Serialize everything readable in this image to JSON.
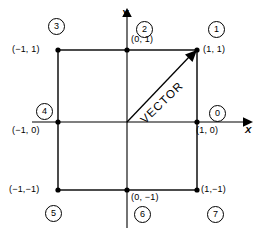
{
  "figure": {
    "axes": {
      "x_label": "X",
      "y_label": "Y"
    },
    "vector_label": "VECTOR",
    "origin": {
      "x": 127,
      "y": 122
    },
    "unit_px": 69,
    "points": [
      {
        "id": 0,
        "code": "0",
        "coord": "(1, 0)",
        "px": 197,
        "py": 122
      },
      {
        "id": 1,
        "code": "1",
        "coord": "(1, 1)",
        "px": 197,
        "py": 50
      },
      {
        "id": 2,
        "code": "2",
        "coord": "(0, 1)",
        "px": 127,
        "py": 50
      },
      {
        "id": 3,
        "code": "3",
        "coord": "(-1, 1)",
        "px": 58,
        "py": 50
      },
      {
        "id": 4,
        "code": "4",
        "coord": "(-1, 0)",
        "px": 58,
        "py": 122
      },
      {
        "id": 5,
        "code": "5",
        "coord": "(-1,-1)",
        "px": 58,
        "py": 190
      },
      {
        "id": 6,
        "code": "6",
        "coord": "(0, -1)",
        "px": 127,
        "py": 190
      },
      {
        "id": 7,
        "code": "7",
        "coord": "(1,-1)",
        "px": 197,
        "py": 190
      }
    ],
    "coord_labels": [
      {
        "name": "coord-label-top-left",
        "text": "(−1, 1)"
      },
      {
        "name": "coord-label-top-mid",
        "text": "(0, 1)"
      },
      {
        "name": "coord-label-top-right",
        "text": "(1, 1)"
      },
      {
        "name": "coord-label-mid-left",
        "text": "(−1, 0)"
      },
      {
        "name": "coord-label-mid-right",
        "text": "(1, 0)"
      },
      {
        "name": "coord-label-bottom-left",
        "text": "(−1,−1)"
      },
      {
        "name": "coord-label-bottom-mid",
        "text": "(0, −1)"
      },
      {
        "name": "coord-label-bottom-right",
        "text": "(1,−1)"
      }
    ],
    "direction_codes": [
      {
        "name": "direction-code-0",
        "text": "0"
      },
      {
        "name": "direction-code-1",
        "text": "1"
      },
      {
        "name": "direction-code-2",
        "text": "2"
      },
      {
        "name": "direction-code-3",
        "text": "3"
      },
      {
        "name": "direction-code-4",
        "text": "4"
      },
      {
        "name": "direction-code-5",
        "text": "5"
      },
      {
        "name": "direction-code-6",
        "text": "6"
      },
      {
        "name": "direction-code-7",
        "text": "7"
      }
    ],
    "colors": {
      "line": "#000000",
      "background": "#ffffff"
    }
  }
}
